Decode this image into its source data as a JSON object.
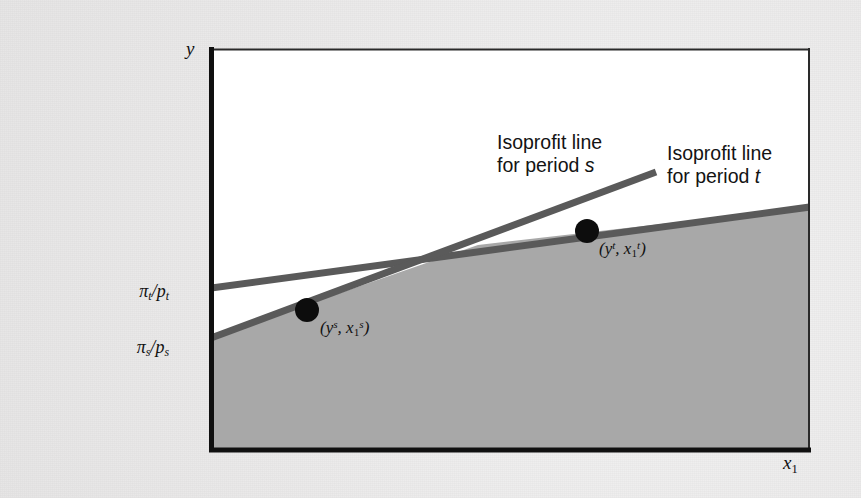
{
  "figure": {
    "type": "diagram",
    "background_color": "#ebebeb",
    "plot": {
      "frame_color": "#161616",
      "upper_region_color": "#ffffff",
      "shaded_region_color": "#a8a8a8",
      "x_px": [
        210,
        810
      ],
      "y_px": [
        48,
        452
      ]
    },
    "axes": {
      "y_label": "y",
      "x_label_base": "x",
      "x_label_sub": "1"
    },
    "intercepts": [
      {
        "name": "pi-t-over-p-t",
        "numerator": "π",
        "numerator_sub": "t",
        "denominator": "p",
        "denominator_sub": "t",
        "y_px": 288
      },
      {
        "name": "pi-s-over-p-s",
        "numerator": "π",
        "numerator_sub": "s",
        "denominator": "p",
        "denominator_sub": "s",
        "y_px": 338
      }
    ],
    "lines": [
      {
        "name": "isoprofit-line-period-s",
        "period": "s",
        "color": "#5a5a5a",
        "width_px": 7,
        "x1_px": 211,
        "y1_px": 338,
        "x2_px": 656,
        "y2_px": 172,
        "slope_note": "steeper"
      },
      {
        "name": "isoprofit-line-period-t",
        "period": "t",
        "color": "#5a5a5a",
        "width_px": 7,
        "x1_px": 211,
        "y1_px": 288,
        "x2_px": 810,
        "y2_px": 207,
        "slope_note": "flatter"
      }
    ],
    "intersection_px": {
      "x": 478,
      "y": 245
    },
    "points": [
      {
        "name": "point-s",
        "label_open": "(",
        "y_var": "y",
        "y_sup": "s",
        "sep": ", ",
        "x_var": "x",
        "x_sub": "1",
        "x_sup": "s",
        "label_close": ")",
        "cx_px": 307,
        "cy_px": 310,
        "r_px": 12,
        "color": "#0d0d0d"
      },
      {
        "name": "point-t",
        "label_open": "(",
        "y_var": "y",
        "y_sup": "t",
        "sep": ", ",
        "x_var": "x",
        "x_sub": "1",
        "x_sup": "t",
        "label_close": ")",
        "cx_px": 587,
        "cy_px": 231,
        "r_px": 12,
        "color": "#0d0d0d"
      }
    ],
    "callouts": [
      {
        "name": "callout-isoprofit-s",
        "line1": "Isoprofit line",
        "line2_prefix": "for period ",
        "line2_italic": "s"
      },
      {
        "name": "callout-isoprofit-t",
        "line1": "Isoprofit line",
        "line2_prefix": "for period ",
        "line2_italic": "t"
      }
    ]
  }
}
